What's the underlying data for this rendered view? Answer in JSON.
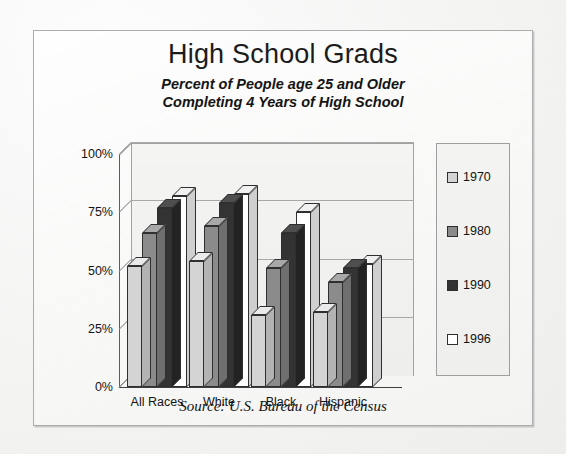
{
  "document": {
    "title": "High School Grads",
    "subtitle_line1": "Percent of People age 25 and Older",
    "subtitle_line2": "Completing 4 Years of High School",
    "source": "Source:  U.S. Bureau of the Census"
  },
  "legend": {
    "position": "right",
    "items": [
      {
        "label": "1970",
        "color": "#d4d4d4"
      },
      {
        "label": "1980",
        "color": "#8b8b8b"
      },
      {
        "label": "1990",
        "color": "#333333"
      },
      {
        "label": "1996",
        "color": "#ffffff"
      }
    ]
  },
  "axis": {
    "y_ticks": [
      "0%",
      "25%",
      "50%",
      "75%",
      "100%"
    ],
    "x_categories": [
      "All Races",
      "White",
      "Black",
      "Hispanic"
    ]
  },
  "chart_data": {
    "type": "bar",
    "title": "High School Grads",
    "subtitle": "Percent of People age 25 and Older Completing 4 Years of High School",
    "xlabel": "",
    "ylabel": "",
    "ylim": [
      0,
      100
    ],
    "ytick_values": [
      0,
      25,
      50,
      75,
      100
    ],
    "ytick_labels": [
      "0%",
      "25%",
      "50%",
      "75%",
      "100%"
    ],
    "grid": true,
    "legend_position": "right",
    "style": "3d-clustered-column",
    "categories": [
      "All Races",
      "White",
      "Black",
      "Hispanic"
    ],
    "series": [
      {
        "name": "1970",
        "color": "#d4d4d4",
        "values": [
          52,
          54,
          31,
          32
        ]
      },
      {
        "name": "1980",
        "color": "#8b8b8b",
        "values": [
          66,
          69,
          51,
          45
        ]
      },
      {
        "name": "1990",
        "color": "#333333",
        "values": [
          77,
          79,
          66,
          51
        ]
      },
      {
        "name": "1996",
        "color": "#ffffff",
        "values": [
          82,
          83,
          75,
          53
        ]
      }
    ],
    "annotations": [
      "Source:  U.S. Bureau of the Census"
    ]
  }
}
